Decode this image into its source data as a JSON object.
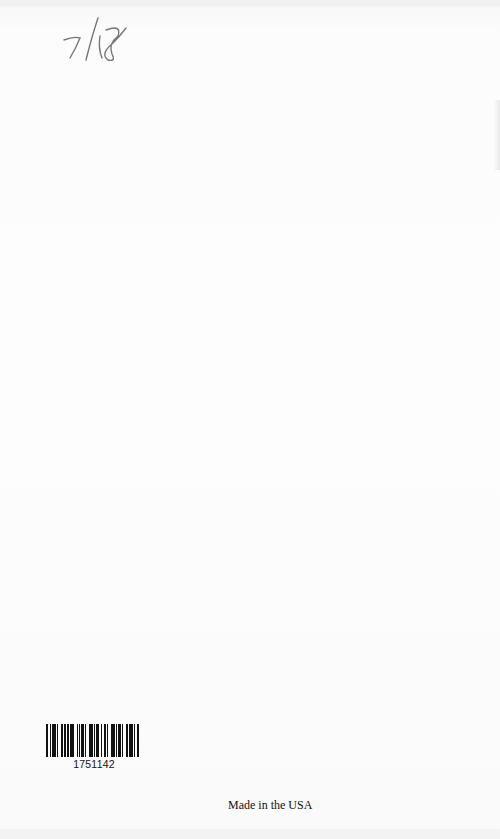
{
  "page": {
    "handwritten_note": "7/18",
    "barcode": {
      "number": "1751142",
      "bars": [
        2,
        1,
        1,
        1,
        3,
        1,
        1,
        2,
        2,
        1,
        1,
        1,
        2,
        1,
        3,
        2,
        1,
        1,
        1,
        1,
        2,
        1,
        1,
        2,
        3,
        1,
        1,
        1,
        2,
        2,
        1,
        1,
        2,
        1,
        1,
        2,
        3,
        1,
        1,
        1,
        2,
        1,
        1,
        2,
        2,
        1,
        3,
        1,
        1,
        1,
        2,
        2
      ]
    },
    "footer_text": "Made in the USA"
  }
}
